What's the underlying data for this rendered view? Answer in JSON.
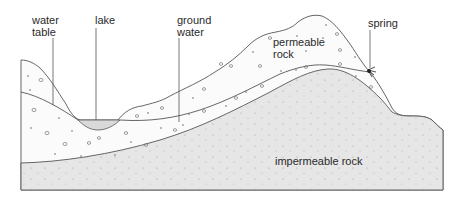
{
  "diagram": {
    "type": "geological cross-section",
    "labels": {
      "water_table": "water\ntable",
      "lake": "lake",
      "ground_water": "ground\nwater",
      "permeable_rock": "permeable\nrock",
      "spring": "spring",
      "impermeable_rock": "impermeable rock"
    },
    "colors": {
      "outline": "#555555",
      "impermeable_fill": "#e6e6e6",
      "permeable_fill": "#fbfbfb",
      "lake_fill": "#d9d9d9",
      "text": "#2a2a2a"
    }
  }
}
